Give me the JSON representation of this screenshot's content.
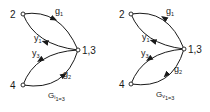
{
  "diagrams": [
    {
      "id": "left",
      "caption": {
        "main": "G",
        "sub1": "i",
        "sub2": "1=3"
      },
      "nodes": [
        {
          "id": "2",
          "label": "2"
        },
        {
          "id": "13",
          "label": "1,3"
        },
        {
          "id": "4",
          "label": "4"
        }
      ],
      "edges": [
        {
          "label": "g",
          "sub": "1",
          "from": "2",
          "to": "1,3"
        },
        {
          "label": "y",
          "sub": "1",
          "from": "1,3",
          "to": "2"
        },
        {
          "label": "y",
          "sub": "3",
          "from": "1,3",
          "to": "4"
        },
        {
          "label": "g",
          "sub": "2",
          "from": "4",
          "to": "1,3"
        }
      ]
    },
    {
      "id": "right",
      "caption": {
        "main": "G",
        "sub1": "v",
        "sub2": "1=3"
      },
      "nodes": [
        {
          "id": "2",
          "label": "2"
        },
        {
          "id": "13",
          "label": "1,3"
        },
        {
          "id": "4",
          "label": "4"
        }
      ],
      "edges": [
        {
          "label": "g",
          "sub": "1",
          "from": "1,3",
          "to": "2"
        },
        {
          "label": "y",
          "sub": "1",
          "from": "1,3",
          "to": "2"
        },
        {
          "label": "y",
          "sub": "3",
          "from": "1,3",
          "to": "4"
        },
        {
          "label": "g",
          "sub": "2",
          "from": "1,3",
          "to": "4"
        }
      ]
    }
  ]
}
